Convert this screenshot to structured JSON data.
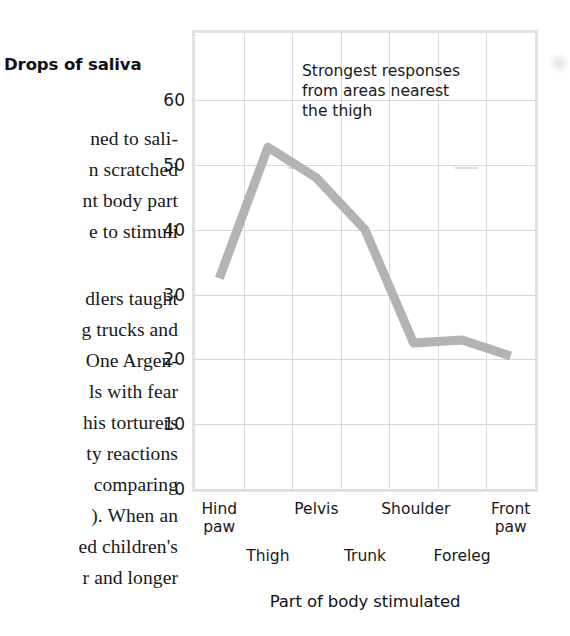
{
  "book_text": {
    "lines": [
      "ned to sali-",
      "n scratched",
      "nt body part",
      "e to stimuli",
      "dlers taught",
      "g trucks and",
      "One Argen-",
      "ls with fear",
      "his torturers",
      "ty reactions",
      "comparing",
      "). When an",
      "ed children's",
      "r and longer"
    ]
  },
  "chart_data": {
    "type": "line",
    "title": "",
    "ylabel": "Drops of saliva",
    "xlabel": "Part of body stimulated",
    "categories": [
      "Hind\npaw",
      "Thigh",
      "Pelvis",
      "Trunk",
      "Shoulder",
      "Foreleg",
      "Front\npaw"
    ],
    "categories_flat": [
      "Hind paw",
      "Thigh",
      "Pelvis",
      "Trunk",
      "Shoulder",
      "Foreleg",
      "Front paw"
    ],
    "values": [
      32.5,
      52.7,
      48.0,
      40.0,
      22.5,
      23.0,
      20.5
    ],
    "ylim": [
      0,
      70.7
    ],
    "yticks": [
      0,
      10,
      20,
      30,
      40,
      50,
      60
    ],
    "ytick_labels": [
      "0",
      "10",
      "20",
      "30",
      "40",
      "50",
      "60"
    ],
    "grid": true,
    "legend": "none",
    "line_color": "#b3b3b3",
    "grid_color": "#d9d9d9",
    "frame_color": "#e2e2e2",
    "annotations": [
      {
        "text": "Strongest responses\nfrom areas nearest\nthe thigh",
        "name": "strongest-responses-note"
      }
    ]
  }
}
